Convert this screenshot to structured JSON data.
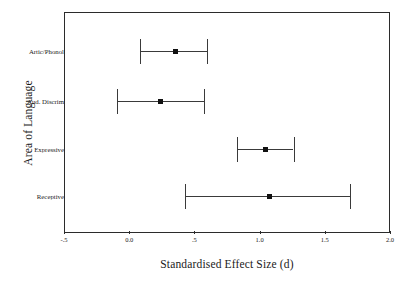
{
  "chart_data": {
    "type": "scatter",
    "title": "",
    "xlabel": "Standardised Effect Size (d)",
    "ylabel": "Area of Language",
    "xlim": [
      -0.5,
      2.0
    ],
    "xticks": [
      "-.5",
      "0.0",
      ".5",
      "1.0",
      "1.5",
      "2.0"
    ],
    "xtick_values": [
      -0.5,
      0.0,
      0.5,
      1.0,
      1.5,
      2.0
    ],
    "categories": [
      "Artic/Phonol",
      "Aud. Discrim",
      "Expressive",
      "Receptive"
    ],
    "grid": false,
    "legend": "none",
    "series": [
      {
        "name": "Standardised effect size with 95% CI",
        "points": [
          {
            "category": "Artic/Phonol",
            "value": 0.35,
            "ci_low": 0.08,
            "ci_high": 0.6
          },
          {
            "category": "Aud. Discrim",
            "value": 0.24,
            "ci_low": -0.09,
            "ci_high": 0.57
          },
          {
            "category": "Expressive",
            "value": 1.04,
            "ci_low": 0.83,
            "ci_high": 1.26
          },
          {
            "category": "Receptive",
            "value": 1.07,
            "ci_low": 0.43,
            "ci_high": 1.69
          }
        ]
      }
    ]
  },
  "axis": {
    "x_title": "Standardised Effect Size (d)",
    "y_title": "Area of Language"
  },
  "ticks": {
    "x": [
      {
        "label": "-.5"
      },
      {
        "label": "0.0"
      },
      {
        "label": ".5"
      },
      {
        "label": "1.0"
      },
      {
        "label": "1.5"
      },
      {
        "label": "2.0"
      }
    ]
  },
  "rows": [
    {
      "label": "Artic/Phonol"
    },
    {
      "label": "Aud. Discrim"
    },
    {
      "label": "Expressive"
    },
    {
      "label": "Receptive"
    }
  ],
  "colors": {
    "frame": "#2b2b2b",
    "whisker": "#3a3a3a",
    "marker": "#111111",
    "background": "#ffffff"
  }
}
